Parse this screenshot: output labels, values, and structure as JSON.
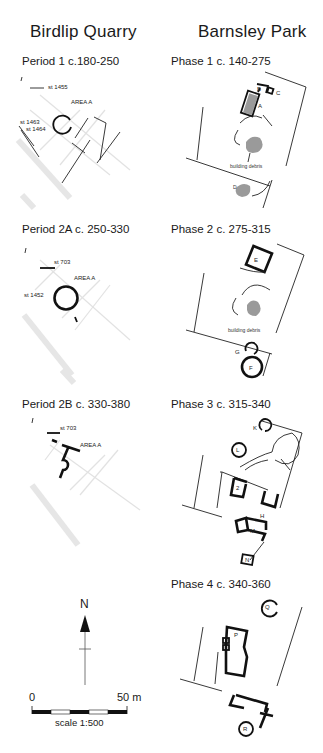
{
  "columns": {
    "left_title": "Birdlip Quarry",
    "right_title": "Barnsley Park"
  },
  "birdlip": [
    {
      "title": "Period 1 c.180-250",
      "labels": {
        "area": "AREA A",
        "st_a": "st 1455",
        "st_b": "st 1463",
        "st_c": "st 1464"
      }
    },
    {
      "title": "Period 2A c. 250-330",
      "labels": {
        "area": "AREA A",
        "st_a": "st 703",
        "st_b": "st 1452"
      }
    },
    {
      "title": "Period 2B c. 330-380",
      "labels": {
        "area": "AREA A",
        "st_a": "st 703"
      }
    }
  ],
  "barnsley": [
    {
      "title": "Phase 1 c. 140-275",
      "labels": {
        "a": "A",
        "b": "B",
        "c": "C",
        "d": "D",
        "debris": "building debris"
      }
    },
    {
      "title": "Phase 2 c. 275-315",
      "labels": {
        "e": "E",
        "f": "F",
        "g": "G",
        "debris": "building debris"
      }
    },
    {
      "title": "Phase 3 c. 315-340",
      "labels": {
        "k": "K",
        "l": "L",
        "two": "2",
        "h": "H",
        "m": "M",
        "n": "N"
      }
    },
    {
      "title": "Phase 4 c. 340-360",
      "labels": {
        "q": "Q",
        "p": "P",
        "r": "R"
      }
    }
  ],
  "north_arrow": {
    "label": "N"
  },
  "scale_bar": {
    "start": "0",
    "end": "50 m",
    "caption": "scale 1:500"
  }
}
